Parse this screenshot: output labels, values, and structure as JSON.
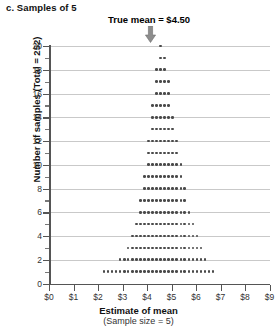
{
  "panel": {
    "title": "c. Samples of 5"
  },
  "annotation": {
    "text": "True mean  =  $4.50",
    "value": 4.5,
    "icon": "down-arrow-icon"
  },
  "axes": {
    "x": {
      "title": "Estimate of mean",
      "subtitle": "(Sample size = 5)",
      "ticks": [
        "$0",
        "$1",
        "$2",
        "$3",
        "$4",
        "$5",
        "$6",
        "$7",
        "$8",
        "$9"
      ],
      "min": 0,
      "max": 9
    },
    "y": {
      "title": "Number of samples (Total = 252)",
      "ticks": [
        "0",
        "2",
        "4",
        "6",
        "8",
        "10",
        "12",
        "14",
        "16",
        "18",
        "20"
      ],
      "min": 0,
      "max": 20
    }
  },
  "chart_data": {
    "type": "bar",
    "title": "c. Samples of 5",
    "xlabel": "Estimate of mean (Sample size = 5)",
    "ylabel": "Number of samples (Total = 252)",
    "xlim": [
      0,
      9
    ],
    "ylim": [
      0,
      20
    ],
    "grid": true,
    "legend": null,
    "style": "stacked-dot-plot",
    "bin_width": 0.165,
    "total_samples": 252,
    "true_mean": 4.5,
    "categories": [
      2.2,
      2.37,
      2.53,
      2.7,
      2.86,
      3.03,
      3.19,
      3.36,
      3.52,
      3.69,
      3.85,
      4.02,
      4.18,
      4.35,
      4.51,
      4.68,
      4.84,
      5.01,
      5.17,
      5.34,
      5.5,
      5.67,
      5.83,
      6.0,
      6.16,
      6.33,
      6.49,
      6.66
    ],
    "values": [
      1,
      1,
      1,
      1,
      2,
      2,
      3,
      4,
      5,
      7,
      9,
      12,
      15,
      18,
      20,
      19,
      17,
      14,
      12,
      10,
      8,
      6,
      5,
      4,
      3,
      2,
      1,
      1
    ],
    "annotations": [
      {
        "text": "True mean  =  $4.50",
        "x": 4.5,
        "type": "arrow-down"
      }
    ]
  }
}
